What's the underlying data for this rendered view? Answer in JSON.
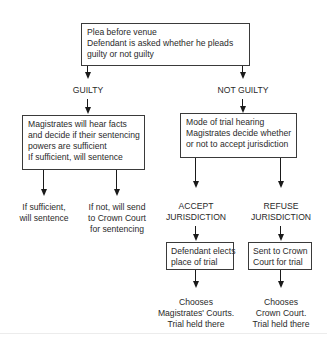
{
  "diagram": {
    "nodes": {
      "plea": {
        "lines": [
          "Plea before venue",
          "Defendant is asked whether he pleads",
          "guilty or not guilty"
        ]
      },
      "guilty_label": "GUILTY",
      "not_guilty_label": "NOT GUILTY",
      "magistrates_facts": {
        "lines": [
          "Magistrates will hear facts",
          "and decide if their sentencing",
          "powers are sufficient",
          "If sufficient, will sentence"
        ]
      },
      "if_sufficient": {
        "lines": [
          "If sufficient,",
          "will sentence"
        ]
      },
      "if_not": {
        "lines": [
          "If not, will send",
          "to Crown Court",
          "for sentencing"
        ]
      },
      "mode_of_trial": {
        "lines": [
          "Mode of trial hearing",
          "Magistrates decide whether",
          "or not to accept jurisdiction"
        ]
      },
      "accept": {
        "lines": [
          "ACCEPT",
          "JURISDICTION"
        ]
      },
      "refuse": {
        "lines": [
          "REFUSE",
          "JURISDICTION"
        ]
      },
      "defendant_elects": {
        "lines": [
          "Defendant elects",
          "place of trial"
        ]
      },
      "sent_to_crown": {
        "lines": [
          "Sent to Crown",
          "Court for trial"
        ]
      },
      "chooses_magistrates": {
        "lines": [
          "Chooses",
          "Magistrates' Courts.",
          "Trial held there"
        ]
      },
      "chooses_crown": {
        "lines": [
          "Chooses",
          "Crown Court.",
          "Trial held there"
        ]
      }
    },
    "edges": [
      [
        "plea",
        "guilty_label"
      ],
      [
        "plea",
        "not_guilty_label"
      ],
      [
        "guilty_label",
        "magistrates_facts"
      ],
      [
        "not_guilty_label",
        "mode_of_trial"
      ],
      [
        "magistrates_facts",
        "if_sufficient"
      ],
      [
        "magistrates_facts",
        "if_not"
      ],
      [
        "mode_of_trial",
        "accept"
      ],
      [
        "mode_of_trial",
        "refuse"
      ],
      [
        "accept",
        "defendant_elects"
      ],
      [
        "refuse",
        "sent_to_crown"
      ],
      [
        "defendant_elects",
        "chooses_magistrates"
      ],
      [
        "sent_to_crown",
        "chooses_crown"
      ]
    ]
  }
}
